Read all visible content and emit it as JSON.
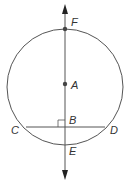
{
  "diagram": {
    "type": "circle-geometry",
    "colors": {
      "stroke": "#555555",
      "point": "#444444",
      "label": "#333333"
    },
    "circle": {
      "cx": 65,
      "cy": 88,
      "r": 58
    },
    "line": {
      "x": 65,
      "y1": 6,
      "y2": 178,
      "arrows": "both"
    },
    "chord": {
      "from": "C",
      "to": "D",
      "y": 127
    },
    "right_angle_at": "B",
    "points": [
      {
        "name": "F",
        "label": "F"
      },
      {
        "name": "A",
        "label": "A"
      },
      {
        "name": "B",
        "label": "B"
      },
      {
        "name": "C",
        "label": "C"
      },
      {
        "name": "D",
        "label": "D"
      },
      {
        "name": "E",
        "label": "E"
      }
    ]
  }
}
